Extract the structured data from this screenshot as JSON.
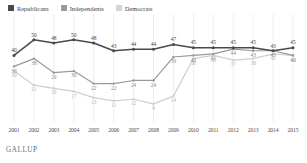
{
  "legend": {
    "position": "top-left",
    "items": [
      {
        "label": "Republicans",
        "color": "#4a4a4a",
        "swatch": "legend-swatch-republicans"
      },
      {
        "label": "Independents",
        "color": "#9a9a9a",
        "swatch": "legend-swatch-independents"
      },
      {
        "label": "Democrats",
        "color": "#d4d4d4",
        "swatch": "legend-swatch-democrats"
      }
    ]
  },
  "source": "GALLUP",
  "chart_data": {
    "type": "line",
    "title": "",
    "xlabel": "",
    "ylabel": "",
    "grid": "vertical-only",
    "ylim": [
      0,
      55
    ],
    "xlim": [
      "2001",
      "2015"
    ],
    "categories": [
      "2001",
      "2002",
      "2003",
      "2004",
      "2005",
      "2006",
      "2007",
      "2008",
      "2009",
      "2010",
      "2011",
      "2012",
      "2013",
      "2014",
      "2015"
    ],
    "series": [
      {
        "name": "Republicans",
        "color": "#4a4a4a",
        "values": [
          40,
          50,
          48,
          50,
          48,
          43,
          44,
          44,
          47,
          45,
          45,
          45,
          45,
          43,
          45
        ]
      },
      {
        "name": "Independents",
        "color": "#9a9a9a",
        "values": [
          33,
          38,
          29,
          30,
          22,
          22,
          24,
          24,
          39,
          40,
          41,
          44,
          43,
          43,
          40
        ]
      },
      {
        "name": "Democrats",
        "color": "#cfcfcf",
        "values": [
          30,
          21,
          19,
          17,
          13,
          11,
          12,
          9,
          14,
          38,
          40,
          37,
          38,
          41,
          40
        ]
      }
    ],
    "axis_ticks": [
      "2001",
      "2002",
      "2003",
      "2004",
      "2005",
      "2006",
      "2007",
      "2008",
      "2009",
      "2010",
      "2011",
      "2012",
      "2013",
      "2014",
      "2015"
    ]
  }
}
